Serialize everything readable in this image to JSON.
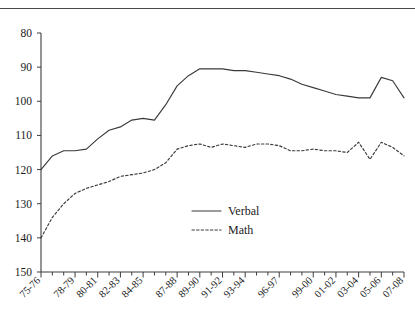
{
  "chart_data": {
    "type": "line",
    "title": "",
    "subtitle": "",
    "xlabel": "",
    "ylabel": "",
    "y_axis_inverted": true,
    "ylim": [
      80,
      150
    ],
    "yticks": [
      80,
      90,
      100,
      110,
      120,
      130,
      140,
      150
    ],
    "ytick_labels": [
      "80",
      "90",
      "100",
      "110",
      "120",
      "130",
      "140",
      "150"
    ],
    "grid": false,
    "legend_position": "center",
    "legend": [
      "Verbal",
      "Math"
    ],
    "x": [
      "75-76",
      "76-77",
      "77-78",
      "78-79",
      "79-80",
      "80-81",
      "81-82",
      "82-83",
      "83-84",
      "84-85",
      "85-86",
      "86-87",
      "87-88",
      "88-89",
      "89-90",
      "90-91",
      "91-92",
      "92-93",
      "93-94",
      "94-95",
      "95-96",
      "96-97",
      "97-98",
      "98-99",
      "99-00",
      "00-01",
      "01-02",
      "02-03",
      "03-04",
      "04-05",
      "05-06",
      "06-07",
      "07-08"
    ],
    "xtick_labels": [
      "75-76",
      "78-79",
      "80-81",
      "82-83",
      "84-85",
      "87-88",
      "89-90",
      "91-92",
      "93-94",
      "96-97",
      "99-00",
      "01-02",
      "03-04",
      "05-06",
      "07-08"
    ],
    "xtick_label_indices": [
      0,
      3,
      5,
      7,
      9,
      12,
      14,
      16,
      18,
      21,
      24,
      26,
      28,
      30,
      32
    ],
    "series": [
      {
        "name": "Verbal",
        "style": "solid",
        "values": [
          120,
          116,
          114.5,
          114.5,
          114,
          111,
          108.5,
          107.5,
          105.5,
          105,
          105.5,
          101,
          95.5,
          92.5,
          90.5,
          90.5,
          90.5,
          91,
          91,
          91.5,
          92,
          92.5,
          93.5,
          95,
          96,
          97,
          98,
          98.5,
          99,
          99,
          93,
          94,
          99
        ]
      },
      {
        "name": "Math",
        "style": "dotted",
        "values": [
          140,
          134,
          130,
          127,
          125.5,
          124.5,
          123.5,
          122,
          121.5,
          121,
          120,
          118,
          114,
          113,
          112.5,
          113.5,
          112.5,
          113,
          113.5,
          112.5,
          112.5,
          113,
          114.5,
          114.5,
          114,
          114.5,
          114.5,
          115,
          112,
          117,
          112,
          113.5,
          116
        ]
      }
    ]
  },
  "axis": {
    "y_top_value": "80",
    "y_bottom_value": "150"
  },
  "legend_items": [
    {
      "label": "Verbal",
      "style": "solid"
    },
    {
      "label": "Math",
      "style": "dotted"
    }
  ]
}
